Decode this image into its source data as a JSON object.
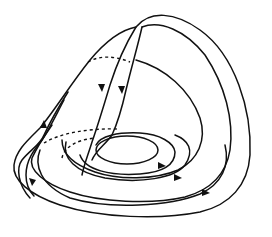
{
  "figure": {
    "type": "phase-portrait",
    "stroke_color": "#111111",
    "background": "#ffffff",
    "curves": [
      {
        "id": "outer-fold-edge",
        "style": "solid"
      },
      {
        "id": "outer-dome",
        "style": "solid"
      },
      {
        "id": "middle-dome",
        "style": "solid"
      },
      {
        "id": "inner-dome",
        "style": "solid"
      },
      {
        "id": "descending-left",
        "style": "solid",
        "arrow": "down"
      },
      {
        "id": "descending-right",
        "style": "solid",
        "arrow": "down"
      },
      {
        "id": "outer-spiral",
        "style": "solid",
        "arrow": "right"
      },
      {
        "id": "second-spiral",
        "style": "solid",
        "arrow": "right"
      },
      {
        "id": "third-spiral",
        "style": "solid",
        "arrow": "right"
      },
      {
        "id": "inner-ellipse",
        "style": "solid"
      },
      {
        "id": "hidden-back-upper",
        "style": "dashed"
      },
      {
        "id": "hidden-back-lower",
        "style": "dashed"
      },
      {
        "id": "hidden-back-inner",
        "style": "dashed"
      }
    ],
    "arrow_count": 7
  }
}
